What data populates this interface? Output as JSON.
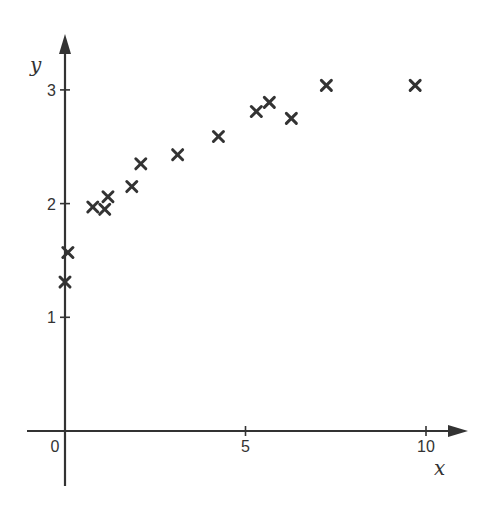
{
  "chart_data": {
    "type": "scatter",
    "title": "",
    "xlabel": "x",
    "ylabel": "y",
    "xlim": [
      -1,
      11
    ],
    "ylim": [
      -0.5,
      3.5
    ],
    "grid": false,
    "legend": null,
    "x_ticks": [
      {
        "value": 0,
        "label": "0"
      },
      {
        "value": 5,
        "label": "5"
      },
      {
        "value": 10,
        "label": "10"
      }
    ],
    "y_ticks": [
      {
        "value": 1,
        "label": "1"
      },
      {
        "value": 2,
        "label": "2"
      },
      {
        "value": 3,
        "label": "3"
      }
    ],
    "marker": "x",
    "color": "#333333",
    "points": [
      {
        "x": 0.0,
        "y": 1.31
      },
      {
        "x": 0.08,
        "y": 1.57
      },
      {
        "x": 0.77,
        "y": 1.97
      },
      {
        "x": 1.1,
        "y": 1.95
      },
      {
        "x": 1.19,
        "y": 2.06
      },
      {
        "x": 1.85,
        "y": 2.15
      },
      {
        "x": 2.1,
        "y": 2.35
      },
      {
        "x": 3.12,
        "y": 2.43
      },
      {
        "x": 4.25,
        "y": 2.59
      },
      {
        "x": 5.3,
        "y": 2.81
      },
      {
        "x": 5.66,
        "y": 2.89
      },
      {
        "x": 6.27,
        "y": 2.75
      },
      {
        "x": 7.24,
        "y": 3.04
      },
      {
        "x": 9.7,
        "y": 3.04
      }
    ]
  }
}
